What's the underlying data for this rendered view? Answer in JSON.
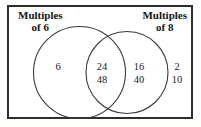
{
  "diagram": {
    "type": "venn-two-set",
    "labels": {
      "left_line1": "Multiples",
      "left_line2": "of 6",
      "right_line1": "Multiples",
      "right_line2": "of 8"
    },
    "regions": {
      "left_only": [
        "6"
      ],
      "intersection": [
        "24",
        "48"
      ],
      "right_only": [
        "16",
        "40"
      ],
      "outside": [
        "2",
        "10"
      ]
    }
  },
  "colors": {
    "frame": "#2e2e2e",
    "circle_stroke": "#3a3a3a",
    "text": "#141414",
    "background": "#ffffff"
  }
}
